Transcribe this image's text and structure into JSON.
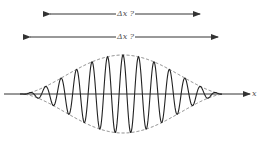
{
  "diagram": {
    "arrows": [
      {
        "label": "Δx ?",
        "x1": 50,
        "x2": 200,
        "y": 14
      },
      {
        "label": "Δx ?",
        "x1": 30,
        "x2": 218,
        "y": 37
      }
    ],
    "axis": {
      "label": "x",
      "y": 94,
      "x1": 4,
      "x2": 250
    },
    "envelope": {
      "x_start": 20,
      "x_end": 222,
      "center_x": 123,
      "amplitude": 39
    },
    "colors": {
      "line": "#333333",
      "envelope": "#777777",
      "background": "#ffffff"
    }
  }
}
